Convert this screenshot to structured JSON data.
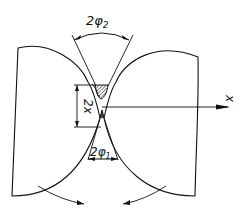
{
  "diagram": {
    "labels": {
      "top_angle": "2φ",
      "top_angle_sub": "2",
      "bottom_angle": "2φ",
      "bottom_angle_sub": "1",
      "gap": "2x",
      "axis": "x"
    },
    "colors": {
      "line": "#111111",
      "background": "#ffffff"
    }
  }
}
